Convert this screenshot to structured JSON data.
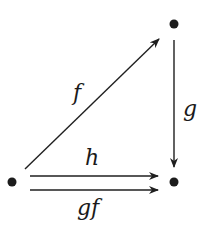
{
  "diagram": {
    "type": "commutative-diagram",
    "nodes": [
      {
        "id": "top-right",
        "x": 174,
        "y": 24,
        "label": ""
      },
      {
        "id": "bottom-left",
        "x": 12,
        "y": 182,
        "label": ""
      },
      {
        "id": "bottom-right",
        "x": 174,
        "y": 182,
        "label": ""
      }
    ],
    "edges": [
      {
        "id": "f",
        "from": "bottom-left",
        "to": "top-right",
        "label": "f"
      },
      {
        "id": "g",
        "from": "top-right",
        "to": "bottom-right",
        "label": "g"
      },
      {
        "id": "h",
        "from": "bottom-left",
        "to": "bottom-right",
        "label": "h"
      },
      {
        "id": "gf",
        "from": "bottom-left",
        "to": "bottom-right",
        "label": "gf"
      }
    ],
    "colors": {
      "ink": "#1f1f1f",
      "background": "#ffffff"
    }
  }
}
